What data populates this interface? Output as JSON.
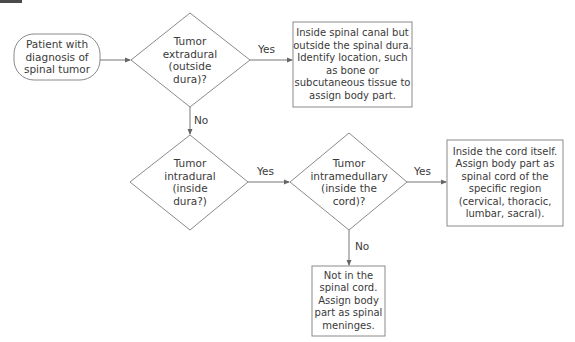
{
  "nodes": {
    "start": "Patient with\ndiagnosis of\nspinal tumor",
    "q_extradural": "Tumor\nextradural\n(outside\ndura)?",
    "r_extradural": "Inside spinal canal but\noutside the spinal dura.\nIdentify location, such\nas bone or\nsubcutaneous tissue to\nassign body part.",
    "q_intradural": "Tumor\nintradural\n(inside\ndura?)",
    "q_intramedullary": "Tumor\nintramedullary\n(inside the\ncord)?",
    "r_intramedullary": "Inside the cord itself.\nAssign body part as\nspinal cord of the\nspecific region\n(cervical, thoracic,\nlumbar, sacral).",
    "r_meninges": "Not in the\nspinal cord.\nAssign body\npart as spinal\nmeninges."
  },
  "edges": {
    "extradural_yes": "Yes",
    "extradural_no": "No",
    "intradural_yes": "Yes",
    "intramedullary_yes": "Yes",
    "intramedullary_no": "No"
  }
}
